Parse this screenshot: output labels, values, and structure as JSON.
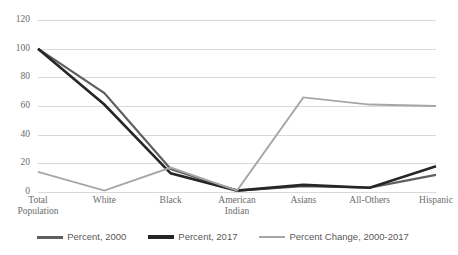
{
  "chart_data": {
    "type": "line",
    "title": "",
    "xlabel": "",
    "ylabel": "",
    "ylim": [
      0,
      120
    ],
    "yticks": [
      0,
      20,
      40,
      60,
      80,
      100,
      120
    ],
    "ytick_labels": [
      "0",
      "20",
      "40",
      "60",
      "80",
      "100",
      "120"
    ],
    "grid": true,
    "legend_position": "bottom",
    "categories": [
      "Total\nPopulation",
      "White",
      "Black",
      "American\nIndian",
      "Asians",
      "All-Others",
      "Hispanic"
    ],
    "series": [
      {
        "name": "Percent, 2000",
        "color": "#5f5f5f",
        "values": [
          100,
          69,
          16,
          1,
          4,
          3,
          12
        ]
      },
      {
        "name": "Percent, 2017",
        "color": "#262626",
        "values": [
          100,
          61,
          13,
          1,
          5,
          3,
          18
        ]
      },
      {
        "name": "Percent Change, 2000-2017",
        "color": "#a6a6a6",
        "values": [
          14,
          1,
          17,
          1,
          66,
          61,
          60
        ]
      }
    ]
  },
  "legend": {
    "items": [
      {
        "label": "Percent, 2000",
        "swatch": "legend-swatch-percent-2000"
      },
      {
        "label": "Percent, 2017",
        "swatch": "legend-swatch-percent-2017"
      },
      {
        "label": "Percent Change, 2000-2017",
        "swatch": "legend-swatch-percent-change"
      }
    ]
  },
  "colors": {
    "gridline": "#d9d9d9",
    "axis_text": "#6b6b6b",
    "legend_text": "#595959",
    "background": "#ffffff"
  }
}
